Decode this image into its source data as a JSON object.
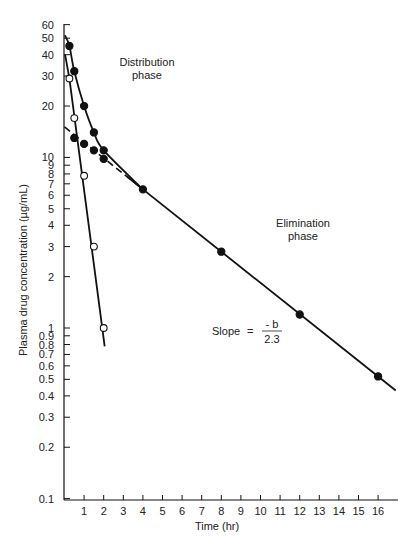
{
  "chart_data": {
    "type": "scatter",
    "title": "",
    "xlabel": "Time (hr)",
    "ylabel": "Plasma drug concentration (µg/mL)",
    "xscale": "linear",
    "yscale": "log",
    "xlim": [
      0,
      17
    ],
    "ylim": [
      0.1,
      60
    ],
    "grid": false,
    "x_ticks": [
      1,
      2,
      3,
      4,
      5,
      6,
      7,
      8,
      9,
      10,
      11,
      12,
      13,
      14,
      15,
      16
    ],
    "y_ticks": [
      0.1,
      0.2,
      0.3,
      0.4,
      0.5,
      0.6,
      0.7,
      0.8,
      0.9,
      1,
      2,
      3,
      4,
      5,
      6,
      7,
      8,
      9,
      10,
      20,
      30,
      40,
      50,
      60
    ],
    "y_tick_labels": [
      "0.1",
      "0.2",
      "0.3",
      "0.4",
      "0.5",
      "0.6",
      "0.7",
      "0.8",
      "0.9",
      "1",
      "2",
      "3",
      "4",
      "5",
      "6",
      "7",
      "8",
      "9",
      "10",
      "20",
      "30",
      "40",
      "50",
      "60"
    ],
    "series": [
      {
        "name": "Observed plasma concentration (filled, biexponential curve)",
        "marker": "filled-circle",
        "x": [
          0.25,
          0.5,
          1,
          1.5,
          2,
          4,
          8,
          12,
          16
        ],
        "y": [
          45,
          32,
          20,
          14,
          11,
          6.5,
          2.8,
          1.2,
          0.52
        ]
      },
      {
        "name": "Back-extrapolated elimination line (filled, dashed)",
        "marker": "filled-circle",
        "line": "dashed",
        "x": [
          0.5,
          1,
          1.5,
          2
        ],
        "y": [
          13,
          12,
          11,
          9.8
        ]
      },
      {
        "name": "Residuals (distribution phase, open)",
        "marker": "open-circle",
        "x": [
          0.25,
          0.5,
          1,
          1.5,
          2
        ],
        "y": [
          29,
          17,
          7.8,
          3.0,
          1.0
        ]
      }
    ],
    "annotations": [
      {
        "text": "Distribution phase",
        "x": 3.5,
        "y": 33
      },
      {
        "text": "Elimination phase",
        "x": 12.5,
        "y": 4.5
      },
      {
        "text": "Slope = -b / 2.3",
        "x": 10.5,
        "y": 1.0
      }
    ]
  },
  "labels": {
    "x_axis": "Time (hr)",
    "y_axis": "Plasma drug concentration (µg/mL)",
    "distribution_line1": "Distribution",
    "distribution_line2": "phase",
    "elimination_line1": "Elimination",
    "elimination_line2": "phase",
    "slope_prefix": "Slope",
    "slope_eq": "=",
    "slope_num": "- b",
    "slope_den": "2.3"
  }
}
